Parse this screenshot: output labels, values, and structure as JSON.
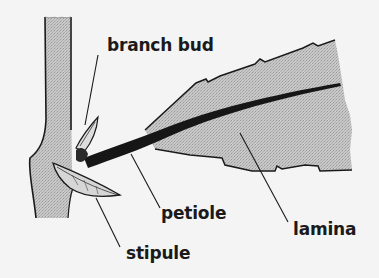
{
  "figure": {
    "colors": {
      "background": "#f4f4f4",
      "fill_gray": "#c4c4c4",
      "ink": "#1a1a1a"
    }
  },
  "labels": {
    "branch_bud": "branch bud",
    "petiole": "petiole",
    "lamina": "lamina",
    "stipule": "stipule"
  }
}
